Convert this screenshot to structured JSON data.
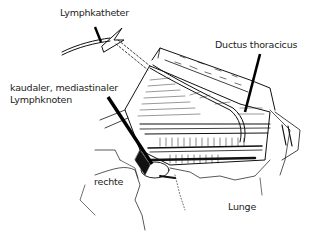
{
  "figure": {
    "type": "anatomical line drawing"
  },
  "labels": {
    "lymphkatheter": "Lymphkatheter",
    "ductus": "Ductus thoracicus",
    "kaudaler_line1": "kaudaler, mediastinaler",
    "kaudaler_line2": "Lymphknoten",
    "rechte": "rechte",
    "lunge": "Lunge"
  },
  "colors": {
    "line": "#111111",
    "text": "#222222",
    "background": "#ffffff"
  }
}
